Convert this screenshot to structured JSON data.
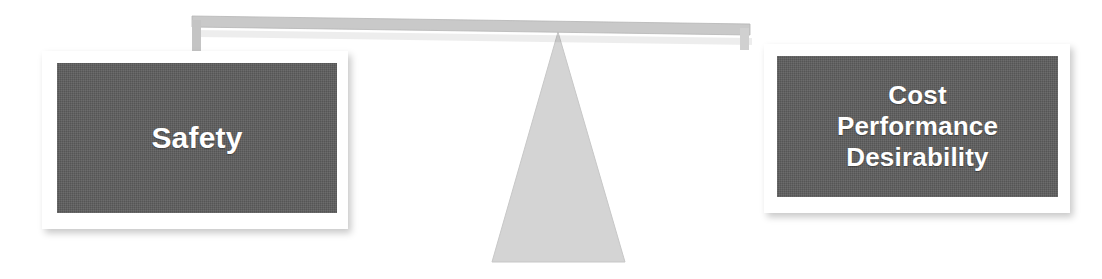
{
  "diagram": {
    "type": "balance-scale",
    "tilt": "left-side-down",
    "left_pan": {
      "label": "Safety",
      "lines": [
        "Safety"
      ]
    },
    "right_pan": {
      "label": "Cost Performance Desirability",
      "lines": [
        "Cost",
        "Performance",
        "Desirability"
      ]
    },
    "fulcrum": {
      "name": "triangle-fulcrum",
      "apex": [
        558,
        32
      ],
      "base_left": [
        492,
        262
      ],
      "base_right": [
        625,
        262
      ]
    },
    "beam": {
      "name": "balance-beam",
      "left_x": 192,
      "right_x": 750,
      "left_y": 16,
      "right_y": 24,
      "thickness": 11
    },
    "colors": {
      "background": "#ffffff",
      "pan_fill": "#5d5d5d",
      "pan_frame": "#ffffff",
      "pan_text": "#ffffff",
      "beam": "#c9c9c9",
      "beam_edge": "#b5b5b5",
      "fulcrum": "#d4d4d4",
      "fulcrum_edge": "#c7c7c7",
      "shadow": "rgba(0,0,0,0.22)"
    }
  }
}
